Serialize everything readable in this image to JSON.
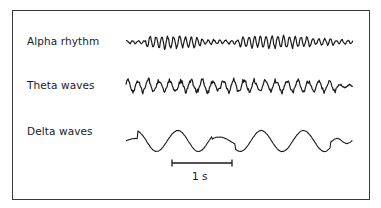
{
  "figure": {
    "title": "",
    "rows": [
      {
        "id": "alpha",
        "label": "Alpha rhythm",
        "description": "fast, low-amplitude regular oscillation (~8-13 Hz)",
        "cycles_per_scale": 10,
        "amplitude": "low-moderate"
      },
      {
        "id": "theta",
        "label": "Theta waves",
        "description": "irregular oscillation, slightly slower and higher amplitude (~4-7 Hz)",
        "cycles_per_scale": 6,
        "amplitude": "moderate"
      },
      {
        "id": "delta",
        "label": "Delta waves",
        "description": "slow, high-amplitude undulations (<4 Hz)",
        "cycles_per_scale": 2,
        "amplitude": "high"
      }
    ],
    "scale_bar": {
      "label": "1 s",
      "duration_seconds": 1
    }
  },
  "colors": {
    "ink": "#1a1a1a",
    "frame": "#3a3a3a",
    "background": "#ffffff"
  }
}
